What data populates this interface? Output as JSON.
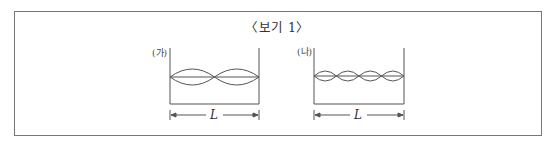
{
  "box": {
    "title": "〈보기 1〉"
  },
  "diagrams": [
    {
      "id": "ga",
      "label": "(가)",
      "dimension": "L",
      "antinodes": 2
    },
    {
      "id": "na",
      "label": "(나)",
      "dimension": "L",
      "antinodes": 4
    }
  ],
  "colors": {
    "line": "#555555",
    "border": "#777777",
    "text": "#333333"
  }
}
